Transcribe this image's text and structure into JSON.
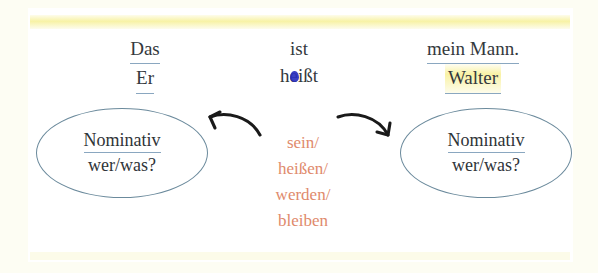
{
  "colors": {
    "page_background": "#fdfdf3",
    "card_background": "#ffffff",
    "underline_blue": "#8aa7c0",
    "highlight_yellow": "#f7ee87",
    "ellipse_stroke": "#6b8a9c",
    "verb_text": "#e08a6c",
    "body_text": "#34393d",
    "blob_blue": "#2a2fbe",
    "arrow": "#1a1a1a"
  },
  "sentence": {
    "left_column": {
      "line1": "Das",
      "line2": "Er"
    },
    "middle_column": {
      "line1": "ist",
      "line2_before": "h",
      "line2_marked_letter": "e",
      "line2_after": "ißt",
      "line2_full": "heißt"
    },
    "right_column": {
      "line1": "mein Mann.",
      "line2": "Walter"
    }
  },
  "ellipse_left": {
    "line1": "Nominativ",
    "line2": "wer/was?"
  },
  "ellipse_right": {
    "line1": "Nominativ",
    "line2": "wer/was?"
  },
  "verbs": {
    "items": [
      "sein/",
      "heißen/",
      "werden/",
      "bleiben"
    ],
    "joined": "sein/ heißen/ werden/ bleiben"
  },
  "arrows": {
    "left_label": "arrow-pointing-left",
    "right_label": "arrow-pointing-right"
  }
}
